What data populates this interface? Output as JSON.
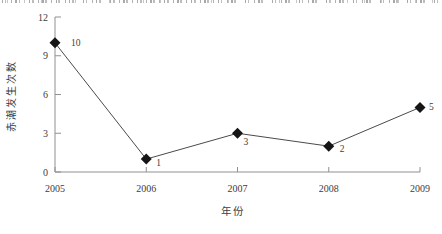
{
  "figure": {
    "background": "#ffffff"
  },
  "chart_data": {
    "type": "line",
    "title": "",
    "categories": [
      "2005",
      "2006",
      "2007",
      "2008",
      "2009"
    ],
    "series": [
      {
        "name": "赤潮发生次数",
        "values": [
          10,
          1,
          3,
          2,
          5
        ]
      }
    ],
    "data_labels": [
      "10",
      "1",
      "3",
      "2",
      "5"
    ],
    "xlabel": "年份",
    "ylabel": "赤潮发生次数",
    "ylim": [
      0,
      12
    ],
    "yticks": [
      0,
      3,
      6,
      9,
      12
    ],
    "grid": false,
    "legend": "none",
    "marker": "diamond",
    "colors": {
      "line": "#4a4a4a",
      "marker": "#151515",
      "axis": "#909090",
      "text": "#3d3d3d"
    }
  }
}
